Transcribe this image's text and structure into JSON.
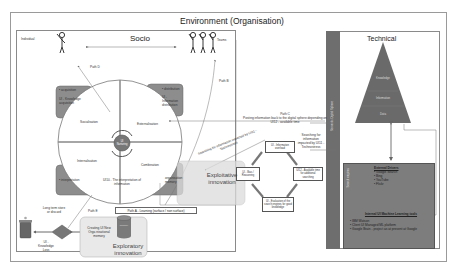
{
  "environment": {
    "title": "Environment (Organisation)"
  },
  "socio": {
    "title": "Socio",
    "individual_label": "Individual",
    "teams_label": "Teams",
    "paths": {
      "path_a": "Path A - Learning (surface / non surface)",
      "path_b": "Path B",
      "path_c_title": "Path C",
      "path_c_desc": "Posting information back to the digital sphere depending on UI12 - available time",
      "path_d": "Path D",
      "path_e": "Path E"
    },
    "quadrants": {
      "socialisation": "Socialisation",
      "externalisation": "Externalisation",
      "internalisation": "Internalisation",
      "combination": "Combination"
    },
    "centre_label": "UI Nurturing",
    "ui10_label": "UI10 - The interpretation of information",
    "boxes": {
      "acquisition": {
        "bullet": "acquisition",
        "label": "UI - Knowledge acquisition"
      },
      "distribution": {
        "bullet": "distribution",
        "label": "UI - Information distribution"
      },
      "interpretation": {
        "bullet": "interpretation"
      },
      "org_memory": {
        "label": "organisation memory"
      }
    },
    "knowledge_loss": {
      "store_label": "Long term store or discard",
      "loss_label": "UI - Knowledge Loss"
    },
    "exploratory": {
      "creating_label": "Creating UI New Orga nisational memory",
      "db_label": "memory",
      "title": "Exploratory innovation"
    },
    "exploitative": {
      "title": "Exploitative innovation"
    },
    "search_impacted_left": "Searching for information impacted by UI11 - Technostress",
    "search_impacted_right": "Searching for information impacted by UI11 - Technostress",
    "cycle": {
      "top": "UI - Information overload",
      "left": "UI - Bias / Reasoning",
      "right": "UI12 - Available time for additional searching",
      "bottom": "UI - Evaluation of the search engines for good knowledge"
    }
  },
  "technical": {
    "title": "Technical",
    "side_label": "Semantic Digital Sphere",
    "pyramid": [
      "Knowledge",
      "Information",
      "Data"
    ],
    "panel": {
      "side_label": "Search engines",
      "external_title": "External Drivers",
      "external_items": [
        "Google Search",
        "Bing",
        "YouTube",
        "Flickr"
      ],
      "internal_title": "Internal UI Machine Learning tools",
      "internal_items": [
        "IBM Watson",
        "Client UI Managed ML platform",
        "Google Brain - project as at present at Google"
      ]
    }
  },
  "colors": {
    "box_grey": "#8d8d8d",
    "dark_grey": "#6e6e6e",
    "pyramid": "#6a6a6a",
    "exploratory_bg": "#e9e9e9"
  }
}
